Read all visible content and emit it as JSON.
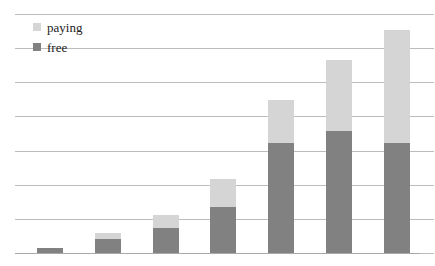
{
  "chart_data": {
    "type": "bar",
    "title": "",
    "subtitle": "",
    "xlabel": "",
    "ylabel": "",
    "stacked": true,
    "grid": true,
    "legend_position": "top-left",
    "axis": {
      "y_min": 0,
      "y_max": 7.7,
      "gridline_interval": 1,
      "gridline_count": 8,
      "gridline_values": [
        7.7,
        6.6,
        5.5,
        4.4,
        3.3,
        2.2,
        1.1,
        0
      ],
      "tick_labels_visible": false,
      "x_tick_labels_visible": false
    },
    "categories": [
      "1",
      "2",
      "3",
      "4",
      "5",
      "6",
      "7"
    ],
    "series": [
      {
        "name": "free",
        "color": "#818181",
        "values": [
          0.16,
          0.45,
          0.81,
          1.48,
          3.55,
          3.94,
          3.55
        ]
      },
      {
        "name": "paying",
        "color": "#d5d5d5",
        "values": [
          0.0,
          0.19,
          0.42,
          0.9,
          1.39,
          2.29,
          3.65
        ]
      }
    ],
    "totals": [
      0.16,
      0.64,
      1.23,
      2.38,
      4.94,
      6.23,
      7.2
    ]
  },
  "legend": {
    "items": [
      {
        "label": "paying",
        "swatch": "legend-swatch-paying",
        "color": "#d5d5d5"
      },
      {
        "label": "free",
        "swatch": "legend-swatch-free",
        "color": "#818181"
      }
    ]
  },
  "colors": {
    "paying": "#d5d5d5",
    "free": "#818181",
    "gridline": "#bcbcbc",
    "baseline": "#a8a8a8",
    "background": "#ffffff",
    "text": "#222222"
  }
}
